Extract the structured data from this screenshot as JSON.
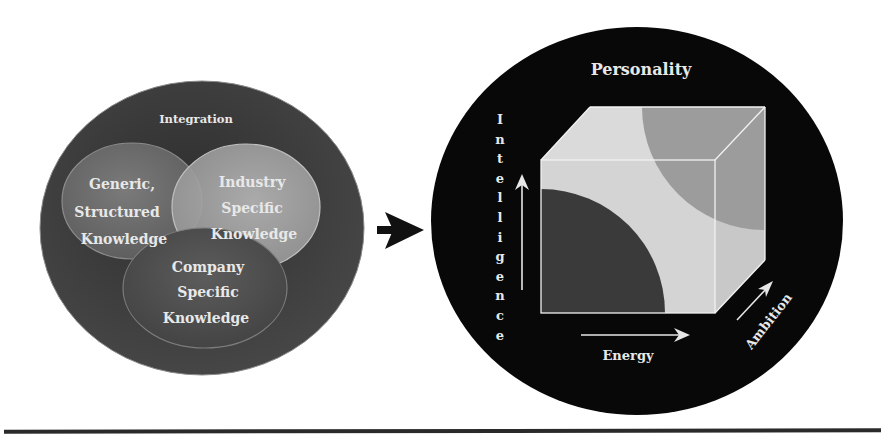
{
  "left_panel": {
    "outer_label": "Integration",
    "sets": [
      {
        "id": "generic",
        "lines": [
          "Generic,",
          "Structured",
          "Knowledge"
        ]
      },
      {
        "id": "industry",
        "lines": [
          "Industry",
          "Specific",
          "Knowledge"
        ]
      },
      {
        "id": "company",
        "lines": [
          "Company",
          "Specific",
          "Knowledge"
        ]
      }
    ]
  },
  "connector": {
    "icon": "arrow-right-icon"
  },
  "right_panel": {
    "title": "Personality",
    "axes": {
      "vertical": {
        "label": "Intelligence",
        "letters": [
          "I",
          "n",
          "t",
          "e",
          "l",
          "l",
          "i",
          "g",
          "e",
          "n",
          "c",
          "e"
        ]
      },
      "horizontal": {
        "label": "Energy"
      },
      "depth": {
        "label": "Ambition"
      }
    }
  },
  "colors": {
    "outer_left": "#3a3a3a",
    "generic_fill": "#6e6e6e",
    "industry_fill": "#a3a3a3",
    "company_fill": "#4d4d4d",
    "outer_right": "#0a0a0a",
    "cube_light": "#d6d6d6",
    "cube_dark": "#3c3c3c",
    "cube_mid": "#9a9a9a",
    "text_light": "#e8e8e8",
    "rule": "#2a2a2a"
  }
}
